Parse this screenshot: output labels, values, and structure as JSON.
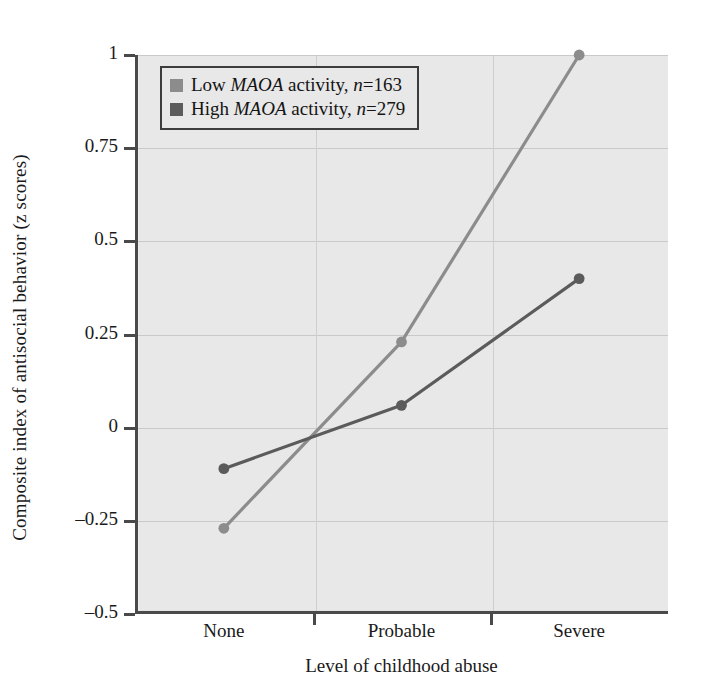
{
  "chart_data": {
    "type": "line",
    "title": "",
    "xlabel": "Level of childhood abuse",
    "ylabel": "Composite index of antisocial behavior (z scores)",
    "categories": [
      "None",
      "Probable",
      "Severe"
    ],
    "xtick_labels": [
      "None",
      "Probable",
      "Severe"
    ],
    "ytick_labels": [
      "1",
      "0.75",
      "0.5",
      "0.25",
      "0",
      "–0.25",
      "–0.5"
    ],
    "ytick_values": [
      1,
      0.75,
      0.5,
      0.25,
      0,
      -0.25,
      -0.5
    ],
    "ylim": [
      -0.5,
      1
    ],
    "xlim": [
      0,
      2
    ],
    "grid": true,
    "legend_position": "top-left",
    "series": [
      {
        "name": "Low MAOA activity, n=163",
        "name_prefix": "Low ",
        "gene": "MAOA",
        "name_mid": " activity, ",
        "n_italic": "n",
        "n_value": "=163",
        "color": "#8c8c8c",
        "values": [
          -0.27,
          0.23,
          1.0
        ]
      },
      {
        "name": "High MAOA activity, n=279",
        "name_prefix": "High ",
        "gene": "MAOA",
        "name_mid": " activity, ",
        "n_italic": "n",
        "n_value": "=279",
        "color": "#5b5b5b",
        "values": [
          -0.11,
          0.06,
          0.4
        ]
      }
    ]
  },
  "colors": {
    "plot_background": "#e8e8e8",
    "axis": "#4a4a4a",
    "gridline": "#c9c9c9",
    "series_low": "#8c8c8c",
    "series_high": "#5b5b5b",
    "text": "#1a1a1a"
  }
}
